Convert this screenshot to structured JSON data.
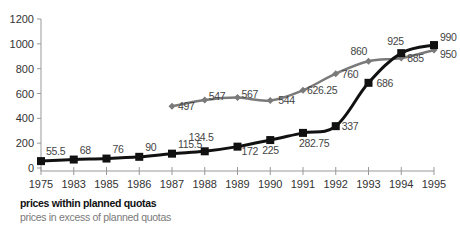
{
  "chart_data": {
    "type": "line",
    "title": "",
    "xlabel": "",
    "ylabel": "",
    "categories": [
      "1975",
      "1983",
      "1985",
      "1986",
      "1987",
      "1988",
      "1989",
      "1990",
      "1991",
      "1992",
      "1993",
      "1994",
      "1995"
    ],
    "ylim": [
      0,
      1200
    ],
    "yticks": [
      0,
      200,
      400,
      600,
      800,
      1000,
      1200
    ],
    "grid": false,
    "legend_position": "bottom-left",
    "series": [
      {
        "name": "prices within planned quotas",
        "color": "#111111",
        "marker": "square",
        "values": [
          55.5,
          68,
          76,
          90,
          115.5,
          134.5,
          172,
          225,
          282.75,
          337,
          686,
          925,
          990
        ],
        "labels": [
          "55.5",
          "68",
          "76",
          "90",
          "115.5",
          "134.5",
          "172",
          "225",
          "282.75",
          "337",
          "686",
          "925",
          "990"
        ]
      },
      {
        "name": "prices in excess of planned quotas",
        "color": "#7a7a7a",
        "marker": "diamond",
        "values": [
          null,
          null,
          null,
          null,
          497,
          547,
          567,
          544,
          626.25,
          760,
          860,
          885,
          950
        ],
        "labels": [
          "",
          "",
          "",
          "",
          "497",
          "547",
          "567",
          "544",
          "626.25",
          "760",
          "860",
          "885",
          "950"
        ]
      }
    ]
  },
  "legend": {
    "items": [
      {
        "label": "prices within planned quotas",
        "color": "#111111"
      },
      {
        "label": "prices in excess of planned quotas",
        "color": "#7a7a7a"
      }
    ]
  }
}
